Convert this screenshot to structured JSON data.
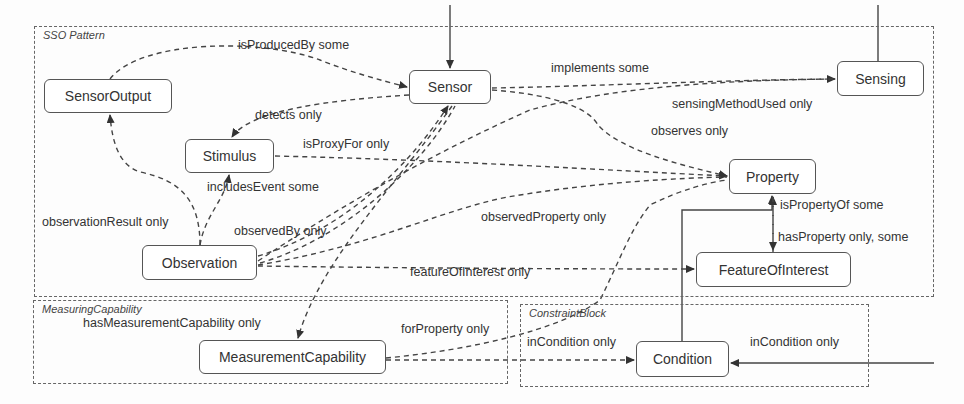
{
  "groups": [
    {
      "id": "sso",
      "title": "SSO Pattern",
      "x": 34,
      "y": 26,
      "w": 900,
      "h": 271
    },
    {
      "id": "measuring",
      "title": "MeasuringCapability",
      "x": 33,
      "y": 300,
      "w": 475,
      "h": 84
    },
    {
      "id": "constraint",
      "title": "ConstraintBlock",
      "x": 520,
      "y": 304,
      "w": 349,
      "h": 83
    }
  ],
  "nodes": [
    {
      "id": "sensor_output",
      "label": "SensorOutput",
      "x": 44,
      "y": 79,
      "w": 128,
      "h": 34
    },
    {
      "id": "sensor",
      "label": "Sensor",
      "x": 409,
      "y": 70,
      "w": 82,
      "h": 34
    },
    {
      "id": "sensing",
      "label": "Sensing",
      "x": 837,
      "y": 61,
      "w": 87,
      "h": 35
    },
    {
      "id": "stimulus",
      "label": "Stimulus",
      "x": 185,
      "y": 139,
      "w": 89,
      "h": 34
    },
    {
      "id": "property",
      "label": "Property",
      "x": 729,
      "y": 159,
      "w": 87,
      "h": 35
    },
    {
      "id": "observation",
      "label": "Observation",
      "x": 142,
      "y": 245,
      "w": 115,
      "h": 35
    },
    {
      "id": "feature_of_interest",
      "label": "FeatureOfInterest",
      "x": 696,
      "y": 252,
      "w": 155,
      "h": 35
    },
    {
      "id": "measurement_capability",
      "label": "MeasurementCapability",
      "x": 199,
      "y": 340,
      "w": 187,
      "h": 34
    },
    {
      "id": "condition",
      "label": "Condition",
      "x": 636,
      "y": 341,
      "w": 93,
      "h": 36
    }
  ],
  "edge_labels": [
    {
      "text": "isProducedBy some",
      "x": 238,
      "y": 38
    },
    {
      "text": "implements some",
      "x": 551,
      "y": 61
    },
    {
      "text": "sensingMethodUsed only",
      "x": 672,
      "y": 98
    },
    {
      "text": "detects only",
      "x": 255,
      "y": 109
    },
    {
      "text": "isProxyFor only",
      "x": 303,
      "y": 138
    },
    {
      "text": "observes only",
      "x": 651,
      "y": 125
    },
    {
      "text": "includesEvent some",
      "x": 207,
      "y": 180
    },
    {
      "text": "observationResult only",
      "x": 42,
      "y": 215
    },
    {
      "text": "observedBy only",
      "x": 234,
      "y": 224
    },
    {
      "text": "observedProperty only",
      "x": 481,
      "y": 211
    },
    {
      "text": "isPropertyOf some",
      "x": 780,
      "y": 199
    },
    {
      "text": "hasProperty only, some",
      "x": 778,
      "y": 231
    },
    {
      "text": "featureOfInterest only",
      "x": 410,
      "y": 266
    },
    {
      "text": "hasMeasurementCapability only",
      "x": 83,
      "y": 316
    },
    {
      "text": "forProperty only",
      "x": 401,
      "y": 323
    },
    {
      "text": "inCondition only",
      "x": 527,
      "y": 335
    },
    {
      "text": "inCondition only",
      "x": 750,
      "y": 336
    }
  ],
  "colors": {
    "line": "#444444",
    "node_border": "#555555",
    "background": "#fdfdfd"
  }
}
